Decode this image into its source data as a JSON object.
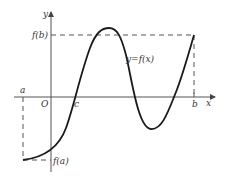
{
  "diagram": {
    "type": "function-graph",
    "axes": {
      "x_label": "x",
      "y_label": "y",
      "origin_label": "O"
    },
    "points": {
      "a": "a",
      "b": "b",
      "c": "c"
    },
    "values": {
      "fa": "f(a)",
      "fb": "f(b)"
    },
    "curve_label": "y=f(x)",
    "colors": {
      "curve": "#1a1a1a",
      "axis": "#555555",
      "dashed": "#555555",
      "background": "#ffffff"
    }
  }
}
